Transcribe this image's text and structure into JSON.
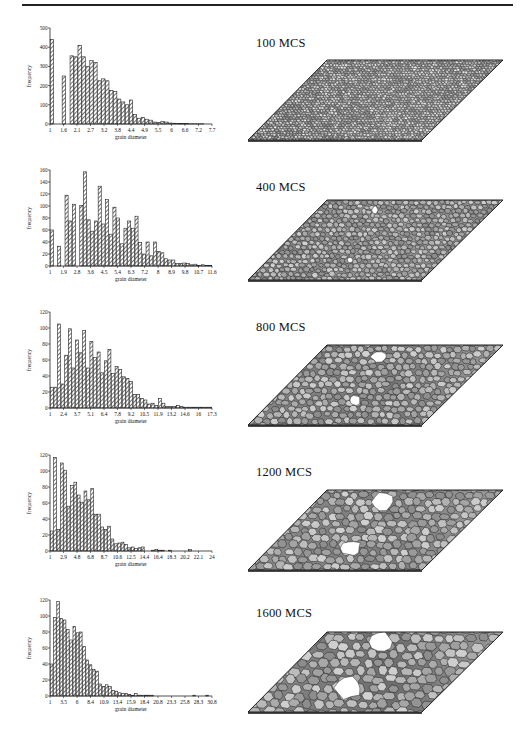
{
  "figure": {
    "panels": [
      {
        "label": "100 MCS"
      },
      {
        "label": "400 MCS"
      },
      {
        "label": "800 MCS"
      },
      {
        "label": "1200 MCS"
      },
      {
        "label": "1600 MCS"
      }
    ]
  },
  "chart_data": [
    {
      "type": "bar",
      "title": "100 MCS",
      "xlabel": "grain diameter",
      "ylabel": "frequency",
      "ylim": [
        0,
        500
      ],
      "yticks": [
        0,
        100,
        200,
        300,
        400,
        500
      ],
      "xtick_labels": [
        "1",
        "1.6",
        "2.1",
        "2.7",
        "3.2",
        "3.8",
        "4.4",
        "4.9",
        "5.5",
        "6",
        "6.6",
        "7.2",
        "7.7"
      ],
      "values": [
        440,
        0,
        0,
        250,
        0,
        355,
        350,
        410,
        350,
        300,
        330,
        320,
        225,
        235,
        225,
        175,
        170,
        130,
        115,
        100,
        125,
        50,
        30,
        35,
        25,
        20,
        10,
        8,
        12,
        10,
        5,
        4,
        3,
        2,
        2,
        1,
        1,
        1,
        1,
        0,
        0
      ]
    },
    {
      "type": "bar",
      "title": "400 MCS",
      "xlabel": "grain diameter",
      "ylabel": "frequency",
      "ylim": [
        0,
        160
      ],
      "yticks": [
        0,
        20,
        40,
        60,
        80,
        100,
        120,
        140,
        160
      ],
      "xtick_labels": [
        "1",
        "1.9",
        "2.8",
        "3.6",
        "4.5",
        "5.4",
        "6.3",
        "7.2",
        "8",
        "8.9",
        "9.8",
        "10.7",
        "11.6"
      ],
      "values": [
        60,
        0,
        33,
        0,
        118,
        75,
        103,
        0,
        101,
        157,
        77,
        58,
        75,
        133,
        70,
        111,
        53,
        98,
        80,
        37,
        63,
        75,
        63,
        83,
        39,
        20,
        40,
        17,
        40,
        24,
        22,
        12,
        10,
        10,
        4,
        4,
        5,
        4,
        2,
        3,
        1,
        2,
        1,
        1
      ]
    },
    {
      "type": "bar",
      "title": "800 MCS",
      "xlabel": "grain diameter",
      "ylabel": "frequency",
      "ylim": [
        0,
        120
      ],
      "yticks": [
        0,
        20,
        40,
        60,
        80,
        100,
        120
      ],
      "xtick_labels": [
        "1",
        "2.4",
        "3.7",
        "5.1",
        "6.4",
        "7.8",
        "9.2",
        "10.5",
        "11.9",
        "13.2",
        "14.6",
        "16",
        "17.3"
      ],
      "values": [
        26,
        26,
        105,
        30,
        66,
        99,
        50,
        85,
        69,
        97,
        50,
        83,
        63,
        70,
        44,
        59,
        73,
        43,
        52,
        48,
        39,
        37,
        33,
        17,
        17,
        12,
        10,
        5,
        6,
        3,
        12,
        6,
        2,
        2,
        2,
        3,
        2,
        1,
        1,
        1,
        1,
        1,
        1,
        1,
        1
      ]
    },
    {
      "type": "bar",
      "title": "1200 MCS",
      "xlabel": "grain diameter",
      "ylabel": "frequency",
      "ylim": [
        0,
        120
      ],
      "yticks": [
        0,
        20,
        40,
        60,
        80,
        100,
        120
      ],
      "xtick_labels": [
        "1",
        "2.9",
        "4.8",
        "6.8",
        "8.7",
        "10.6",
        "12.5",
        "14.4",
        "16.4",
        "18.3",
        "20.2",
        "22.1",
        "24"
      ],
      "values": [
        25,
        117,
        27,
        110,
        101,
        56,
        82,
        86,
        70,
        61,
        75,
        64,
        78,
        46,
        46,
        30,
        27,
        31,
        15,
        9,
        10,
        11,
        8,
        4,
        5,
        3,
        4,
        5,
        0,
        0,
        1,
        2,
        1,
        1,
        0,
        1,
        0,
        0,
        0,
        0,
        0,
        2,
        0,
        0,
        0,
        0,
        0,
        0
      ]
    },
    {
      "type": "bar",
      "title": "1600 MCS",
      "xlabel": "grain diameter",
      "ylabel": "frequency",
      "ylim": [
        0,
        120
      ],
      "yticks": [
        0,
        20,
        40,
        60,
        80,
        100,
        120
      ],
      "xtick_labels": [
        "1",
        "3.5",
        "6",
        "8.4",
        "10.9",
        "13.4",
        "15.9",
        "18.4",
        "20.8",
        "23.3",
        "25.8",
        "28.3",
        "30.8"
      ],
      "values": [
        40,
        98,
        118,
        97,
        95,
        83,
        70,
        87,
        79,
        80,
        62,
        45,
        39,
        33,
        31,
        15,
        12,
        14,
        12,
        7,
        6,
        4,
        3,
        3,
        2,
        1,
        3,
        1,
        1,
        1,
        1,
        1,
        0,
        0,
        0,
        0,
        0,
        0,
        0,
        0,
        0,
        0,
        0,
        0,
        1,
        0,
        0,
        0,
        1,
        0
      ]
    }
  ]
}
